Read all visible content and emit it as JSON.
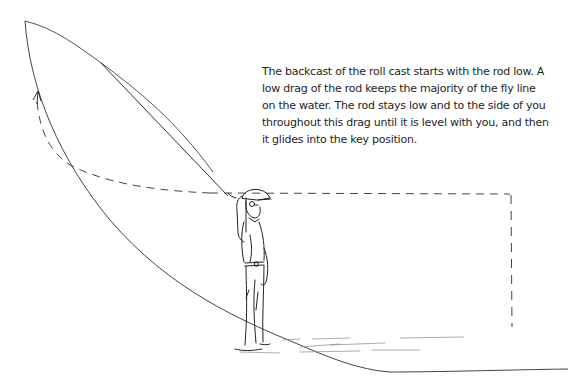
{
  "figure": {
    "caption_lines": [
      "The backcast of the roll cast starts with the rod low. A",
      "low drag of the rod keeps the majority of the fly line",
      "on the water. The rod stays low and to the side of you",
      "throughout this drag until it is level with you, and then",
      "it glides into the key position."
    ],
    "colors": {
      "ink": "#2a2a2a",
      "line": "#555555",
      "background": "#ffffff"
    }
  }
}
